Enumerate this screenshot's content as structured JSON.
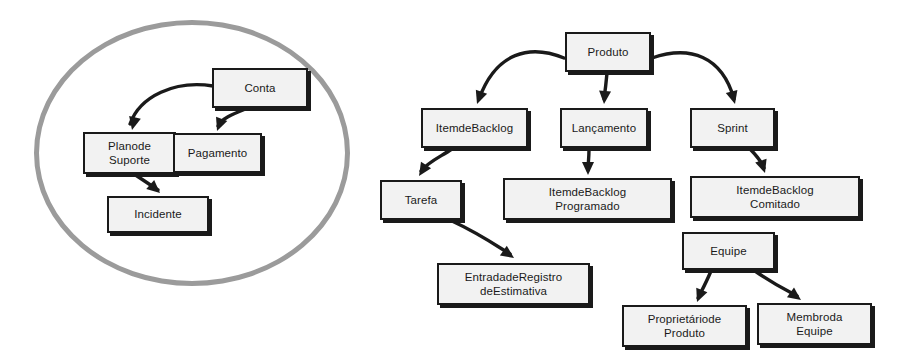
{
  "diagram": {
    "colors": {
      "node_fill": "#f2f2f2",
      "node_border": "#1a1a1a",
      "edge": "#1a1a1a",
      "group_outline": "#9b9b9b",
      "background": "#ffffff"
    },
    "groups": [
      {
        "id": "grupo-conta",
        "shape": "ellipse",
        "label": "",
        "x": 34,
        "y": 20,
        "width": 316,
        "height": 266
      }
    ],
    "nodes": [
      {
        "id": "conta",
        "label": "Conta",
        "x": 212,
        "y": 68,
        "width": 96,
        "height": 40
      },
      {
        "id": "plano-de-suporte",
        "label": "Planode\nSuporte",
        "x": 83,
        "y": 132,
        "width": 93,
        "height": 42
      },
      {
        "id": "pagamento",
        "label": "Pagamento",
        "x": 173,
        "y": 133,
        "width": 89,
        "height": 40
      },
      {
        "id": "incidente",
        "label": "Incidente",
        "x": 107,
        "y": 196,
        "width": 102,
        "height": 37
      },
      {
        "id": "produto",
        "label": "Produto",
        "x": 565,
        "y": 32,
        "width": 86,
        "height": 40
      },
      {
        "id": "item-de-backlog",
        "label": "ItemdeBacklog",
        "x": 421,
        "y": 108,
        "width": 107,
        "height": 40
      },
      {
        "id": "lancamento",
        "label": "Lançamento",
        "x": 560,
        "y": 108,
        "width": 88,
        "height": 40
      },
      {
        "id": "sprint",
        "label": "Sprint",
        "x": 690,
        "y": 108,
        "width": 85,
        "height": 40
      },
      {
        "id": "tarefa",
        "label": "Tarefa",
        "x": 380,
        "y": 180,
        "width": 82,
        "height": 40
      },
      {
        "id": "item-backlog-programado",
        "label": "ItemdeBacklog\nProgramado",
        "x": 503,
        "y": 178,
        "width": 169,
        "height": 42
      },
      {
        "id": "item-backlog-comitado",
        "label": "ItemdeBacklog\nComitado",
        "x": 690,
        "y": 176,
        "width": 170,
        "height": 42
      },
      {
        "id": "entrada-registro-estimativa",
        "label": "EntradadeRegistro\ndeEstimativa",
        "x": 437,
        "y": 263,
        "width": 153,
        "height": 42
      },
      {
        "id": "equipe",
        "label": "Equipe",
        "x": 682,
        "y": 232,
        "width": 93,
        "height": 38
      },
      {
        "id": "proprietario-produto",
        "label": "Proprietáriode\nProduto",
        "x": 622,
        "y": 305,
        "width": 125,
        "height": 42
      },
      {
        "id": "membro-da-equipe",
        "label": "Membroda\nEquipe",
        "x": 757,
        "y": 303,
        "width": 115,
        "height": 42
      }
    ],
    "edges": [
      {
        "id": "conta-to-plano-de-suporte",
        "from": "conta",
        "to": "plano-de-suporte",
        "path": "M 213,86 C 175,80 140,96 130,124",
        "arrow_at": [
          132,
          130
        ]
      },
      {
        "id": "conta-to-pagamento",
        "from": "conta",
        "to": "pagamento",
        "path": "M 248,108 C 233,114 222,118 218,126",
        "arrow_at": [
          217,
          131
        ]
      },
      {
        "id": "plano-de-suporte-to-incidente",
        "from": "plano-de-suporte",
        "to": "incidente",
        "path": "M 131,172 C 146,182 152,186 158,190",
        "arrow_at": [
          160,
          193
        ]
      },
      {
        "id": "produto-to-item-de-backlog",
        "from": "produto",
        "to": "item-de-backlog",
        "path": "M 564,58 C 530,44 496,52 479,99",
        "arrow_at": [
          477,
          104
        ]
      },
      {
        "id": "produto-to-lancamento",
        "from": "produto",
        "to": "lancamento",
        "path": "M 607,73 C 606,84 605,92 604,99",
        "arrow_at": [
          604,
          104
        ]
      },
      {
        "id": "produto-to-sprint",
        "from": "produto",
        "to": "sprint",
        "path": "M 652,58 C 690,45 722,56 734,99",
        "arrow_at": [
          735,
          104
        ]
      },
      {
        "id": "item-de-backlog-to-tarefa",
        "from": "item-de-backlog",
        "to": "tarefa",
        "path": "M 452,149 C 440,157 428,162 421,171",
        "arrow_at": [
          419,
          176
        ]
      },
      {
        "id": "lancamento-to-item-backlog-programado",
        "from": "lancamento",
        "to": "item-backlog-programado",
        "path": "M 589,149 C 589,158 588,165 588,170",
        "arrow_at": [
          588,
          175
        ]
      },
      {
        "id": "sprint-to-item-backlog-comitado",
        "from": "sprint",
        "to": "item-backlog-comitado",
        "path": "M 750,149 C 757,156 761,161 764,168",
        "arrow_at": [
          765,
          173
        ]
      },
      {
        "id": "tarefa-to-entrada-registro",
        "from": "tarefa",
        "to": "entrada-registro-estimativa",
        "path": "M 452,221 C 478,233 494,244 510,254",
        "arrow_at": [
          514,
          258
        ]
      },
      {
        "id": "equipe-to-proprietario-produto",
        "from": "equipe",
        "to": "proprietario-produto",
        "path": "M 711,271 C 706,283 701,292 698,298",
        "arrow_at": [
          697,
          302
        ]
      },
      {
        "id": "equipe-to-membro-da-equipe",
        "from": "equipe",
        "to": "membro-da-equipe",
        "path": "M 755,271 C 775,285 790,292 797,296",
        "arrow_at": [
          801,
          300
        ]
      }
    ]
  }
}
